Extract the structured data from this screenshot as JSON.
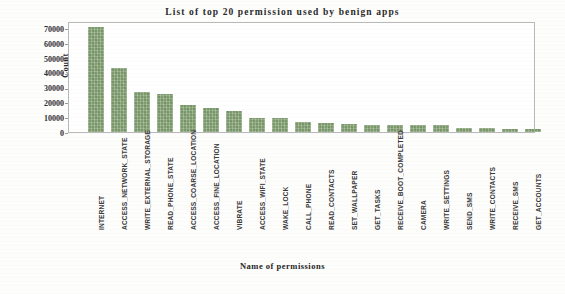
{
  "chart_data": {
    "type": "bar",
    "title": "List of top 20 permission used by benign apps",
    "xlabel": "Name of permissions",
    "ylabel": "Count",
    "ylim": [
      0,
      75000
    ],
    "yticks": [
      0,
      10000,
      20000,
      30000,
      40000,
      50000,
      60000,
      70000
    ],
    "ytick_labels": [
      "0",
      "10000",
      "20000",
      "30000",
      "40000",
      "50000",
      "60000",
      "70000"
    ],
    "grid": false,
    "legend": null,
    "bar_color": "#7d9b6d",
    "categories": [
      "INTERNET",
      "ACCESS_NETWORK_STATE",
      "WRITE_EXTERNAL_STORAGE",
      "READ_PHONE_STATE",
      "ACCESS_COARSE_LOCATION",
      "ACCESS_FINE_LOCATION",
      "VIBRATE",
      "ACCESS_WIFI_STATE",
      "WAKE_LOCK",
      "CALL_PHONE",
      "READ_CONTACTS",
      "SET_WALLPAPER",
      "GET_TASKS",
      "RECEIVE_BOOT_COMPLETED",
      "CAMERA",
      "WRITE_SETTINGS",
      "SEND_SMS",
      "WRITE_CONTACTS",
      "RECEIVE_SMS",
      "GET_ACCOUNTS"
    ],
    "values": [
      71000,
      43000,
      27000,
      25500,
      18000,
      16500,
      14000,
      9500,
      9500,
      6500,
      6300,
      5200,
      5000,
      4800,
      4700,
      4500,
      3000,
      2600,
      1900,
      1700
    ]
  }
}
